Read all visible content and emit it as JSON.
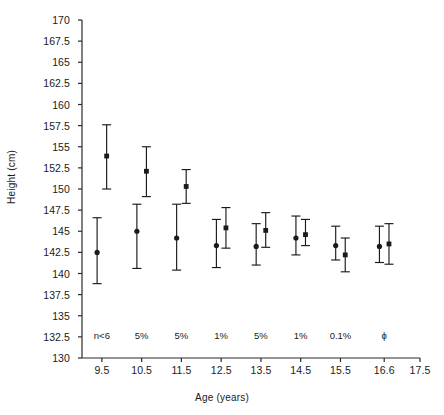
{
  "chart_data": {
    "type": "scatter",
    "title": "",
    "xlabel": "Age (years)",
    "ylabel": "Height (cm)",
    "xlim": [
      9.0,
      17.5
    ],
    "ylim": [
      130,
      170
    ],
    "ytick_step": 2.5,
    "grid": false,
    "legend_position": "none",
    "categories": [
      "9.5",
      "10.5",
      "11.5",
      "12.5",
      "13.5",
      "14.5",
      "15.5",
      "16.6"
    ],
    "x_tick_labels": [
      "9.5",
      "10.5",
      "11.5",
      "12.5",
      "13.5",
      "14.5",
      "15.5",
      "16.6",
      "17.5"
    ],
    "y_tick_labels": [
      "130",
      "132.5",
      "135",
      "137.5",
      "140",
      "142.5",
      "145",
      "147.5",
      "150",
      "152.5",
      "155",
      "157.5",
      "160",
      "162.5",
      "165",
      "167.5",
      "170"
    ],
    "annotations": [
      "n<6",
      "5%",
      "5%",
      "1%",
      "5%",
      "1%",
      "0.1%",
      "ϕ"
    ],
    "annotation_note": "significance level printed above each age group",
    "series": [
      {
        "name": "series-circle",
        "marker": "filled-circle",
        "offset": -0.12,
        "points": [
          {
            "x": "9.5",
            "y": 142.5,
            "low": 138.8,
            "high": 146.6
          },
          {
            "x": "10.5",
            "y": 145.0,
            "low": 140.6,
            "high": 148.2
          },
          {
            "x": "11.5",
            "y": 144.2,
            "low": 140.4,
            "high": 148.2
          },
          {
            "x": "12.5",
            "y": 143.3,
            "low": 140.7,
            "high": 146.4
          },
          {
            "x": "13.5",
            "y": 143.2,
            "low": 141.0,
            "high": 145.9
          },
          {
            "x": "14.5",
            "y": 144.2,
            "low": 142.2,
            "high": 146.8
          },
          {
            "x": "15.5",
            "y": 143.3,
            "low": 141.6,
            "high": 145.6
          },
          {
            "x": "16.6",
            "y": 143.2,
            "low": 141.3,
            "high": 145.6
          }
        ]
      },
      {
        "name": "series-square",
        "marker": "filled-square",
        "offset": 0.12,
        "points": [
          {
            "x": "9.5",
            "y": 153.9,
            "low": 150.0,
            "high": 157.6
          },
          {
            "x": "10.5",
            "y": 152.1,
            "low": 149.1,
            "high": 155.0
          },
          {
            "x": "11.5",
            "y": 150.3,
            "low": 148.3,
            "high": 152.3
          },
          {
            "x": "12.5",
            "y": 145.4,
            "low": 143.0,
            "high": 147.8
          },
          {
            "x": "13.5",
            "y": 145.1,
            "low": 143.1,
            "high": 147.2
          },
          {
            "x": "14.5",
            "y": 144.6,
            "low": 143.3,
            "high": 146.4
          },
          {
            "x": "15.5",
            "y": 142.2,
            "low": 140.2,
            "high": 144.2
          },
          {
            "x": "16.6",
            "y": 143.5,
            "low": 141.1,
            "high": 145.9
          }
        ]
      }
    ]
  },
  "colors": {
    "axis": "#2b2b2b",
    "marker": "#1a1a1a",
    "background": "#ffffff"
  }
}
